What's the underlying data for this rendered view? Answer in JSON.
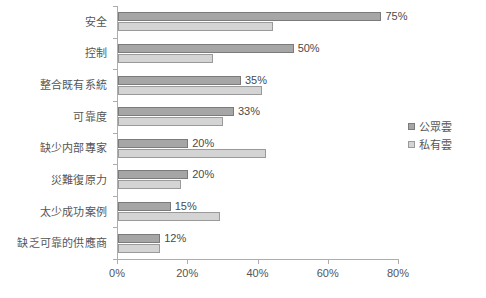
{
  "chart_data": {
    "type": "bar",
    "orientation": "horizontal",
    "title": "",
    "subtitle": "",
    "xlabel": "",
    "ylabel": "",
    "xlim": [
      0,
      80
    ],
    "grid": false,
    "legend_position": "right",
    "x_tick_labels": [
      "0%",
      "20%",
      "40%",
      "60%",
      "80%"
    ],
    "x_tick_values": [
      0,
      20,
      40,
      60,
      80
    ],
    "categories": [
      "安全",
      "控制",
      "整合既有系統",
      "可靠度",
      "缺少内部專家",
      "災難復原力",
      "太少成功案例",
      "缺乏可靠的供應商"
    ],
    "series": [
      {
        "name": "公眾雲",
        "color": "#a6a6a6",
        "values": [
          75,
          50,
          35,
          33,
          20,
          20,
          15,
          12
        ],
        "data_labels": [
          "75%",
          "50%",
          "35%",
          "33%",
          "20%",
          "20%",
          "15%",
          "12%"
        ]
      },
      {
        "name": "私有雲",
        "color": "#d4d4d4",
        "values": [
          44,
          27,
          41,
          30,
          42,
          18,
          29,
          12
        ],
        "data_labels": [
          "",
          "",
          "",
          "",
          "",
          "",
          "",
          ""
        ]
      }
    ]
  },
  "legend": {
    "items": [
      {
        "label": "公眾雲",
        "swatch": "public"
      },
      {
        "label": "私有雲",
        "swatch": "private"
      }
    ]
  }
}
